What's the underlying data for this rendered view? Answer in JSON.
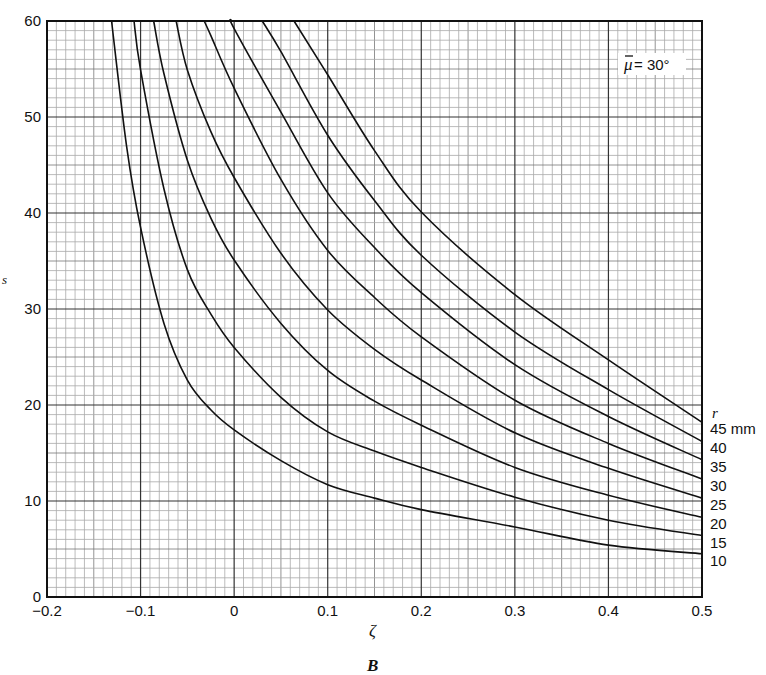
{
  "chart_data": {
    "type": "line",
    "title": "",
    "caption": "B",
    "xlabel": "ζ",
    "ylabel": "s",
    "xlim": [
      -0.2,
      0.5
    ],
    "ylim": [
      0,
      60
    ],
    "xticks": [
      -0.2,
      -0.1,
      0,
      0.1,
      0.2,
      0.3,
      0.4,
      0.5
    ],
    "xtick_labels": [
      "−0.2",
      "−0.1",
      "0",
      "0.1",
      "0.2",
      "0.3",
      "0.4",
      "0.5"
    ],
    "yticks": [
      0,
      10,
      20,
      30,
      40,
      50,
      60
    ],
    "ytick_labels": [
      "0",
      "10",
      "20",
      "30",
      "40",
      "50",
      "60"
    ],
    "grid": {
      "major": true,
      "minor": true,
      "x_minor_step": 0.01,
      "y_minor_step": 1
    },
    "annotation": "μ̄ = 30°",
    "annotation_parts": {
      "symbol": "μ",
      "text": " = 30°"
    },
    "annotation_position": "top-right",
    "legend_title": "r",
    "legend_placement": "right-end-of-curves",
    "series": [
      {
        "name": "10",
        "label": "10",
        "x": [
          -0.131,
          -0.115,
          -0.1,
          -0.075,
          -0.05,
          -0.025,
          0,
          0.05,
          0.1,
          0.15,
          0.2,
          0.3,
          0.4,
          0.5
        ],
        "y": [
          60,
          47,
          38.5,
          28.5,
          22.6,
          19.5,
          17.4,
          14.2,
          11.7,
          10.3,
          9.1,
          7.3,
          5.4,
          4.5
        ]
      },
      {
        "name": "15",
        "label": "15",
        "x": [
          -0.107,
          -0.1,
          -0.075,
          -0.05,
          -0.025,
          0,
          0.05,
          0.1,
          0.15,
          0.2,
          0.3,
          0.4,
          0.5
        ],
        "y": [
          60,
          54.9,
          42.5,
          34.1,
          29.5,
          26.0,
          20.8,
          17.2,
          15.2,
          13.5,
          10.4,
          8.0,
          6.4
        ]
      },
      {
        "name": "20",
        "label": "20",
        "x": [
          -0.086,
          -0.075,
          -0.05,
          -0.025,
          0,
          0.05,
          0.1,
          0.15,
          0.2,
          0.3,
          0.4,
          0.5
        ],
        "y": [
          60,
          54.5,
          45.5,
          39.5,
          35.1,
          28.5,
          23.6,
          20.4,
          17.9,
          13.5,
          10.6,
          8.3
        ]
      },
      {
        "name": "25",
        "label": "25",
        "x": [
          -0.062,
          -0.05,
          -0.025,
          0,
          0.05,
          0.1,
          0.15,
          0.2,
          0.3,
          0.4,
          0.5
        ],
        "y": [
          60,
          54.9,
          48.5,
          43.7,
          35.8,
          29.9,
          25.8,
          22.6,
          17.1,
          13.4,
          10.3
        ]
      },
      {
        "name": "30",
        "label": "30",
        "x": [
          -0.032,
          -0.025,
          0,
          0.05,
          0.1,
          0.15,
          0.2,
          0.3,
          0.4,
          0.5
        ],
        "y": [
          60,
          58.5,
          53.0,
          43.5,
          36.1,
          31.2,
          27.1,
          20.5,
          16.0,
          12.3
        ]
      },
      {
        "name": "35",
        "label": "35",
        "x": [
          -0.002,
          0,
          0.05,
          0.1,
          0.15,
          0.2,
          0.3,
          0.4,
          0.5
        ],
        "y": [
          60,
          59.2,
          50.5,
          42.1,
          36.4,
          31.7,
          24.2,
          18.8,
          14.3
        ]
      },
      {
        "name": "40",
        "label": "40",
        "x": [
          0.03,
          0.05,
          0.1,
          0.15,
          0.2,
          0.3,
          0.4,
          0.5
        ],
        "y": [
          60,
          56.8,
          48.1,
          41.3,
          35.6,
          27.6,
          21.6,
          16.2
        ]
      },
      {
        "name": "45",
        "label": "45 mm",
        "x": [
          0.064,
          0.1,
          0.15,
          0.2,
          0.3,
          0.4,
          0.5
        ],
        "y": [
          60,
          54.4,
          46.5,
          40.1,
          31.5,
          24.7,
          18.2
        ]
      }
    ]
  }
}
